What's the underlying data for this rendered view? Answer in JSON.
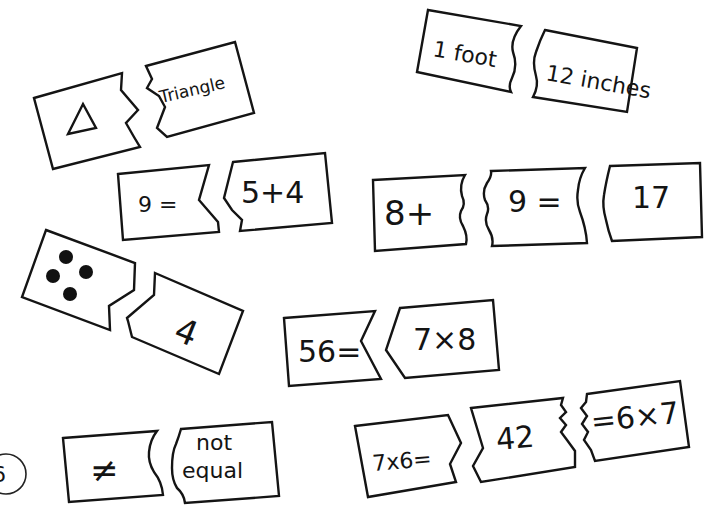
{
  "colors": {
    "ink": "#141414",
    "paper": "#ffffff"
  },
  "pairs": [
    {
      "id": "triangle",
      "left": {
        "symbol": "triangle-icon",
        "text": ""
      },
      "right": {
        "text": "Triangle"
      },
      "cut": "zigzag"
    },
    {
      "id": "foot",
      "left": {
        "text": "1 foot"
      },
      "right": {
        "text": "12 inches"
      },
      "cut": "wave"
    },
    {
      "id": "nine",
      "left": {
        "text": "9 ="
      },
      "right": {
        "text": "5+4"
      },
      "cut": "notch"
    },
    {
      "id": "sum",
      "pieces": [
        {
          "text": "8+"
        },
        {
          "text": "9 ="
        },
        {
          "text": "17"
        }
      ],
      "cut": "wave"
    },
    {
      "id": "dots",
      "left": {
        "symbol": "four-dots-icon",
        "count": 4
      },
      "right": {
        "text": "4"
      },
      "cut": "step"
    },
    {
      "id": "fiftysix",
      "left": {
        "text": "56="
      },
      "right": {
        "text": "7×8"
      },
      "cut": "chevron"
    },
    {
      "id": "notequal",
      "left": {
        "text": "≠"
      },
      "right": {
        "line1": "not",
        "line2": "equal"
      },
      "cut": "wave"
    },
    {
      "id": "fortytwo",
      "pieces": [
        {
          "text": "7x6="
        },
        {
          "text": "42"
        },
        {
          "text": "=6×7"
        }
      ],
      "cut": "chevron-zigzag"
    }
  ],
  "corner_mark": {
    "text": "6"
  }
}
